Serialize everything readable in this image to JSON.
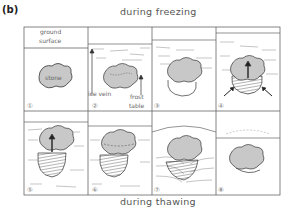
{
  "figure": {
    "panel_label": "(b)",
    "caption_top": "during freezing",
    "caption_bottom": "during thawing",
    "labels": {
      "ground_surface_1": "ground",
      "ground_surface_2": "surface",
      "stone": "stone",
      "ice_vein": "ice vein",
      "frost_table_1": "frost",
      "frost_table_2": "table"
    },
    "steps": [
      "①",
      "②",
      "③",
      "④",
      "⑤",
      "⑥",
      "⑦",
      "⑧"
    ],
    "colors": {
      "stone_fill": "#c8c8c8",
      "stroke": "#333333",
      "frame": "#666666"
    }
  }
}
